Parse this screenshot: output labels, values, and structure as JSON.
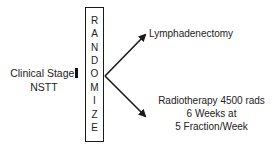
{
  "diagram": {
    "type": "randomization-flow",
    "input": {
      "line1": "Clinical Stage",
      "stage_marker": "I",
      "line2": "NSTT"
    },
    "randomize_box": {
      "letters": [
        "R",
        "A",
        "N",
        "D",
        "O",
        "M",
        "I",
        "Z",
        "E"
      ]
    },
    "arms": [
      {
        "label": "Lymphadenectomy"
      },
      {
        "lines": [
          "Radiotherapy 4500 rads",
          "6 Weeks at",
          "5 Fraction/Week"
        ]
      }
    ],
    "colors": {
      "stroke": "#1a1a1a",
      "text": "#222222",
      "background": "#ffffff"
    }
  }
}
